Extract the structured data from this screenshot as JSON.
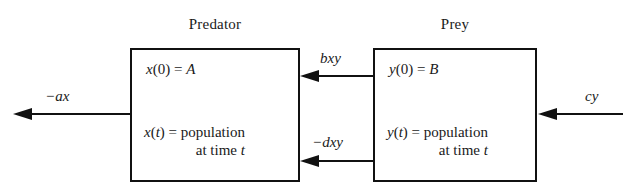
{
  "diagram": {
    "type": "predator-prey-flow-diagram",
    "background_color": "#ffffff",
    "stroke_color": "#111111"
  },
  "predator": {
    "title": "Predator",
    "initial_condition": "x(0) = A",
    "population_line_1": "x(t) = population",
    "population_line_2": "at time t"
  },
  "prey": {
    "title": "Prey",
    "initial_condition": "y(0) = B",
    "population_line_1": "y(t) = population",
    "population_line_2": "at time t"
  },
  "flows": {
    "predator_out": "−ax",
    "prey_to_predator": "bxy",
    "predator_to_prey": "−dxy",
    "prey_in": "cy"
  }
}
